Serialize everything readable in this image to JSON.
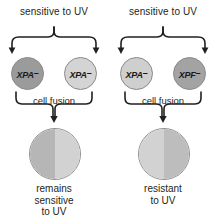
{
  "diagram": {
    "stroke_color": "#231f20",
    "panels": [
      {
        "id": "left",
        "heading": "sensitive to UV",
        "cells": [
          {
            "gene": "XPA",
            "superscript": "–",
            "shade": "dark",
            "color": "#9b9b9b"
          },
          {
            "gene": "XPA",
            "superscript": "–",
            "shade": "light",
            "color": "#d4d4d4"
          }
        ],
        "fusion_label": "cell fusion",
        "fused_cell": {
          "left_half_color": "#b6b6b6",
          "right_half_color": "#d2d2d2"
        },
        "caption_lines": [
          "remains",
          "sensitive",
          "to UV"
        ]
      },
      {
        "id": "right",
        "heading": "sensitive to UV",
        "cells": [
          {
            "gene": "XPA",
            "superscript": "–",
            "shade": "light",
            "color": "#cfcfcf"
          },
          {
            "gene": "XPF",
            "superscript": "–",
            "shade": "dark",
            "color": "#a3a3a3"
          }
        ],
        "fusion_label": "cell fusion",
        "fused_cell": {
          "left_half_color": "#d2d2d2",
          "right_half_color": "#bdbdbd"
        },
        "caption_lines": [
          "resistant",
          "to UV"
        ]
      }
    ]
  }
}
